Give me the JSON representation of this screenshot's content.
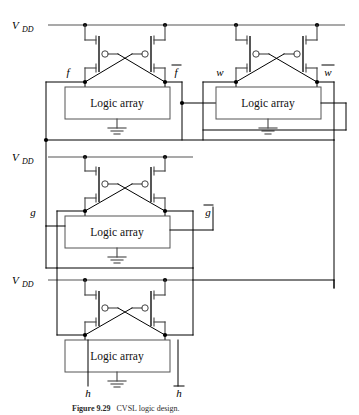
{
  "figure": {
    "caption_number": "Figure 9.29",
    "caption_text": "CVSL logic design.",
    "background": "#ffffff",
    "ink": "#000000"
  },
  "supply_labels": [
    {
      "id": "vdd-top",
      "base": "V",
      "sub": "DD",
      "x": 12,
      "y": 29
    },
    {
      "id": "vdd-middle",
      "base": "V",
      "sub": "DD",
      "x": 12,
      "y": 161
    },
    {
      "id": "vdd-bottom",
      "base": "V",
      "sub": "DD",
      "x": 12,
      "y": 284
    }
  ],
  "blocks": [
    {
      "id": "block-f",
      "label": "Logic array",
      "signal_true": "f",
      "signal_bar": "f",
      "box": {
        "x": 65,
        "y": 87,
        "w": 105,
        "h": 32
      },
      "text_xy": {
        "x": 117,
        "y": 107
      }
    },
    {
      "id": "block-w",
      "label": "Logic array",
      "signal_true": "w",
      "signal_bar": "w",
      "box": {
        "x": 216,
        "y": 87,
        "w": 105,
        "h": 32
      },
      "text_xy": {
        "x": 268,
        "y": 107
      }
    },
    {
      "id": "block-g",
      "label": "Logic array",
      "signal_true": "g",
      "signal_bar": "g",
      "box": {
        "x": 65,
        "y": 216,
        "w": 105,
        "h": 32
      },
      "text_xy": {
        "x": 117,
        "y": 236
      }
    },
    {
      "id": "block-h",
      "label": "Logic array",
      "signal_true": "h",
      "signal_bar": "h",
      "box": {
        "x": 65,
        "y": 340,
        "w": 105,
        "h": 32
      },
      "text_xy": {
        "x": 117,
        "y": 360
      }
    }
  ],
  "signal_labels": [
    {
      "id": "sig-f",
      "text": "f",
      "bar": false,
      "x": 68,
      "y": 76
    },
    {
      "id": "sig-fbar",
      "text": "f",
      "bar": true,
      "x": 174,
      "y": 76
    },
    {
      "id": "sig-w",
      "text": "w",
      "bar": false,
      "x": 219,
      "y": 76
    },
    {
      "id": "sig-wbar",
      "text": "w",
      "bar": true,
      "x": 325,
      "y": 76
    },
    {
      "id": "sig-g",
      "text": "g",
      "bar": false,
      "x": 31,
      "y": 215
    },
    {
      "id": "sig-gbar",
      "text": "g",
      "bar": true,
      "x": 206,
      "y": 215
    },
    {
      "id": "sig-h",
      "text": "h",
      "bar": false,
      "x": 83,
      "y": 392
    },
    {
      "id": "sig-hbar",
      "text": "h",
      "bar": true,
      "x": 173,
      "y": 392
    }
  ],
  "transistors": [
    {
      "id": "pmos-f-left",
      "type": "pmos",
      "cell": "f"
    },
    {
      "id": "pmos-f-right",
      "type": "pmos",
      "cell": "f"
    },
    {
      "id": "pmos-w-left",
      "type": "pmos",
      "cell": "w"
    },
    {
      "id": "pmos-w-right",
      "type": "pmos",
      "cell": "w"
    },
    {
      "id": "pmos-g-left",
      "type": "pmos",
      "cell": "g"
    },
    {
      "id": "pmos-g-right",
      "type": "pmos",
      "cell": "g"
    },
    {
      "id": "pmos-h-left",
      "type": "pmos",
      "cell": "h"
    },
    {
      "id": "pmos-h-right",
      "type": "pmos",
      "cell": "h"
    }
  ],
  "grounds": [
    {
      "id": "gnd-f",
      "x": 117,
      "y": 124
    },
    {
      "id": "gnd-w",
      "x": 268,
      "y": 124
    },
    {
      "id": "gnd-g",
      "x": 117,
      "y": 253
    },
    {
      "id": "gnd-h",
      "x": 117,
      "y": 377
    }
  ]
}
